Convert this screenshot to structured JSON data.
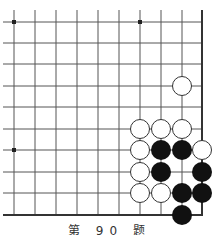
{
  "diagram": {
    "type": "go-problem",
    "caption": "第 90 题",
    "board": {
      "columns_x": [
        14,
        35,
        56,
        77,
        98,
        119,
        140,
        161,
        182,
        202
      ],
      "rows_y": [
        22,
        43,
        64,
        86,
        107,
        129,
        150,
        172,
        193,
        215
      ],
      "right_edge_col": 9,
      "bottom_edge_row": 9,
      "line_color": "#555555",
      "edge_color": "#333333",
      "star_points": [
        {
          "col": 0,
          "row": 0
        },
        {
          "col": 6,
          "row": 0
        },
        {
          "col": 0,
          "row": 6
        }
      ]
    },
    "stones": [
      {
        "color": "white",
        "col": 8,
        "row": 3
      },
      {
        "color": "white",
        "col": 6,
        "row": 5
      },
      {
        "color": "white",
        "col": 7,
        "row": 5
      },
      {
        "color": "white",
        "col": 8,
        "row": 5
      },
      {
        "color": "white",
        "col": 6,
        "row": 6
      },
      {
        "color": "black",
        "col": 7,
        "row": 6
      },
      {
        "color": "black",
        "col": 8,
        "row": 6
      },
      {
        "color": "white",
        "col": 9,
        "row": 6
      },
      {
        "color": "white",
        "col": 6,
        "row": 7
      },
      {
        "color": "black",
        "col": 7,
        "row": 7
      },
      {
        "color": "black",
        "col": 9,
        "row": 7
      },
      {
        "color": "white",
        "col": 6,
        "row": 8
      },
      {
        "color": "white",
        "col": 7,
        "row": 8
      },
      {
        "color": "black",
        "col": 8,
        "row": 8
      },
      {
        "color": "black",
        "col": 9,
        "row": 8
      },
      {
        "color": "black",
        "col": 8,
        "row": 9
      }
    ],
    "colors": {
      "black_stone": "#111111",
      "white_stone_fill": "#ffffff",
      "white_stone_stroke": "#333333"
    }
  }
}
